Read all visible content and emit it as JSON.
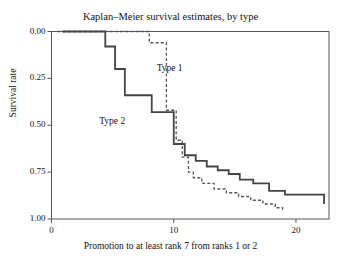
{
  "figure": {
    "ghost_text": "",
    "title": "Kaplan–Meier survival estimates, by type",
    "xlabel": "Promotion to at least rank 7 from ranks 1 or 2",
    "ylabel": "Survival rate",
    "frame_color": "#555555",
    "type1_label": "Type 1",
    "type2_label": "Type 2"
  },
  "axes": {
    "yticks": [
      "1.00",
      "0.75",
      "0.50",
      "0.25",
      "0.00"
    ],
    "xticks": [
      "0",
      "10",
      "20"
    ]
  },
  "chart_data": {
    "type": "line",
    "title": "Kaplan–Meier survival estimates, by type",
    "xlabel": "Promotion to at least rank 7 from ranks 1 or 2",
    "ylabel": "Survival rate",
    "xlim": [
      0,
      22.7
    ],
    "ylim": [
      0,
      1.0
    ],
    "xticks": [
      0,
      10,
      20
    ],
    "yticks": [
      0,
      0.25,
      0.5,
      0.75,
      1.0
    ],
    "grid": false,
    "legend": "inline-annotations",
    "step_style": "post",
    "series": [
      {
        "name": "Type 1",
        "style": "dashed",
        "color": "#555555",
        "annotation": "Type 1",
        "annotation_xy": [
          8.6,
          0.8
        ],
        "x": [
          0.5,
          7.2,
          8.0,
          8.4,
          9.4,
          9.8,
          10.2,
          10.7,
          11.2,
          11.6,
          12.3,
          13.3,
          14.3,
          15.3,
          16.3,
          17.3,
          18.3,
          18.9
        ],
        "y": [
          1.0,
          1.0,
          0.94,
          0.94,
          0.58,
          0.58,
          0.42,
          0.33,
          0.25,
          0.22,
          0.19,
          0.16,
          0.14,
          0.12,
          0.1,
          0.08,
          0.06,
          0.05
        ]
      },
      {
        "name": "Type 2",
        "style": "solid",
        "color": "#444444",
        "annotation": "Type 2",
        "annotation_xy": [
          3.9,
          0.52
        ],
        "x": [
          0.9,
          3.6,
          4.4,
          5.2,
          6.0,
          7.2,
          8.2,
          9.2,
          10.0,
          10.9,
          11.8,
          12.7,
          13.6,
          14.5,
          15.4,
          16.5,
          17.8,
          19.1,
          22.3
        ],
        "y": [
          1.0,
          1.0,
          0.92,
          0.8,
          0.66,
          0.66,
          0.57,
          0.57,
          0.4,
          0.34,
          0.31,
          0.28,
          0.26,
          0.24,
          0.21,
          0.19,
          0.15,
          0.13,
          0.08
        ]
      }
    ]
  }
}
